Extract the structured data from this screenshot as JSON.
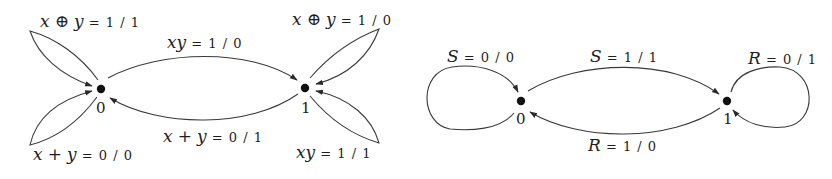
{
  "diagrams": [
    {
      "name": "left-state-diagram",
      "states": [
        "0",
        "1"
      ],
      "transitions": [
        {
          "id": "t0_loop_top",
          "from": "0",
          "to": "0",
          "var": "x",
          "op": "⊕",
          "var2": "y",
          "value": "= 1 / 1"
        },
        {
          "id": "t0_loop_bottom",
          "from": "0",
          "to": "0",
          "var": "x",
          "op": "+",
          "var2": "y",
          "value": "= 0 / 0"
        },
        {
          "id": "t0_to_1",
          "from": "0",
          "to": "1",
          "var": "x",
          "op": "",
          "var2": "y",
          "value": "= 1 / 0"
        },
        {
          "id": "t1_to_0",
          "from": "1",
          "to": "0",
          "var": "x",
          "op": "+",
          "var2": "y",
          "value": "= 0 / 1"
        },
        {
          "id": "t1_loop_top",
          "from": "1",
          "to": "1",
          "var": "x",
          "op": "⊕",
          "var2": "y",
          "value": "= 1 / 0"
        },
        {
          "id": "t1_loop_bottom",
          "from": "1",
          "to": "1",
          "var": "x",
          "op": "",
          "var2": "y",
          "value": "= 1 / 1"
        }
      ]
    },
    {
      "name": "right-state-diagram",
      "states": [
        "0",
        "1"
      ],
      "transitions": [
        {
          "id": "s0_loop",
          "from": "0",
          "to": "0",
          "var": "S",
          "value": "= 0 / 0"
        },
        {
          "id": "s0_to_1",
          "from": "0",
          "to": "1",
          "var": "S",
          "value": "= 1 / 1"
        },
        {
          "id": "s1_to_0",
          "from": "1",
          "to": "0",
          "var": "R",
          "value": "= 1 / 0"
        },
        {
          "id": "s1_loop",
          "from": "1",
          "to": "1",
          "var": "R",
          "value": "= 0 / 1"
        }
      ]
    }
  ],
  "colors": {
    "ink": "#1e1e1e",
    "edge": "#3a3a3a",
    "background": "#ffffff"
  }
}
